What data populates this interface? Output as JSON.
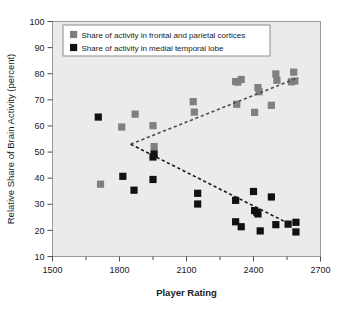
{
  "chart_data": {
    "type": "scatter",
    "title": "",
    "xlabel": "Player Rating",
    "ylabel": "Relative Share of Brain Activity (percent)",
    "xlim": [
      1500,
      2700
    ],
    "ylim": [
      10,
      100
    ],
    "xticks": [
      1500,
      1800,
      2100,
      2400,
      2700
    ],
    "xtick_labels": [
      "1500",
      "1800",
      "2100",
      "2400",
      "2700"
    ],
    "xminor_step": 150,
    "yticks": [
      10,
      20,
      30,
      40,
      50,
      60,
      70,
      80,
      90,
      100
    ],
    "ytick_labels": [
      "10",
      "20",
      "30",
      "40",
      "50",
      "60",
      "70",
      "80",
      "90",
      "100"
    ],
    "grid": false,
    "legend_position": "upper-left",
    "plot_background": "#ebebeb",
    "series": [
      {
        "name": "Share of activity in frontal and parietal cortices",
        "color": "#808080",
        "marker": "square",
        "points": [
          [
            1715,
            37.7
          ],
          [
            1810,
            59.6
          ],
          [
            1870,
            64.5
          ],
          [
            1950,
            60.1
          ],
          [
            1955,
            52.1
          ],
          [
            2130,
            69.3
          ],
          [
            2135,
            65.3
          ],
          [
            2320,
            77.0
          ],
          [
            2330,
            76.8
          ],
          [
            2345,
            77.8
          ],
          [
            2325,
            68.3
          ],
          [
            2405,
            65.2
          ],
          [
            2420,
            74.7
          ],
          [
            2425,
            73.1
          ],
          [
            2500,
            79.9
          ],
          [
            2505,
            77.5
          ],
          [
            2480,
            67.9
          ],
          [
            2580,
            80.6
          ],
          [
            2570,
            76.9
          ],
          [
            2585,
            77.2
          ]
        ],
        "trendline": {
          "x": [
            1850,
            2600
          ],
          "y": [
            53.0,
            78.5
          ],
          "style": "dashed",
          "color": "#4d4d4d"
        }
      },
      {
        "name": "Share of activity in medial temporal lobe",
        "color": "#111111",
        "marker": "square",
        "points": [
          [
            1705,
            63.4
          ],
          [
            1955,
            49.3
          ],
          [
            1815,
            40.7
          ],
          [
            1950,
            48.1
          ],
          [
            1950,
            39.5
          ],
          [
            1865,
            35.4
          ],
          [
            2150,
            34.2
          ],
          [
            2150,
            30.1
          ],
          [
            2320,
            31.5
          ],
          [
            2320,
            23.3
          ],
          [
            2345,
            21.4
          ],
          [
            2400,
            34.9
          ],
          [
            2405,
            27.6
          ],
          [
            2415,
            27.0
          ],
          [
            2420,
            26.3
          ],
          [
            2430,
            19.8
          ],
          [
            2480,
            32.8
          ],
          [
            2500,
            22.2
          ],
          [
            2555,
            22.4
          ],
          [
            2590,
            23.1
          ],
          [
            2590,
            19.4
          ]
        ],
        "trendline": {
          "x": [
            1850,
            2560
          ],
          "y": [
            53.0,
            22.5
          ],
          "style": "dashed",
          "color": "#1a1a1a"
        }
      }
    ]
  },
  "legend": {
    "items": [
      {
        "label": "Share of activity in frontal and parietal cortices",
        "color": "#808080"
      },
      {
        "label": "Share of activity in medial temporal lobe",
        "color": "#111111"
      }
    ]
  }
}
